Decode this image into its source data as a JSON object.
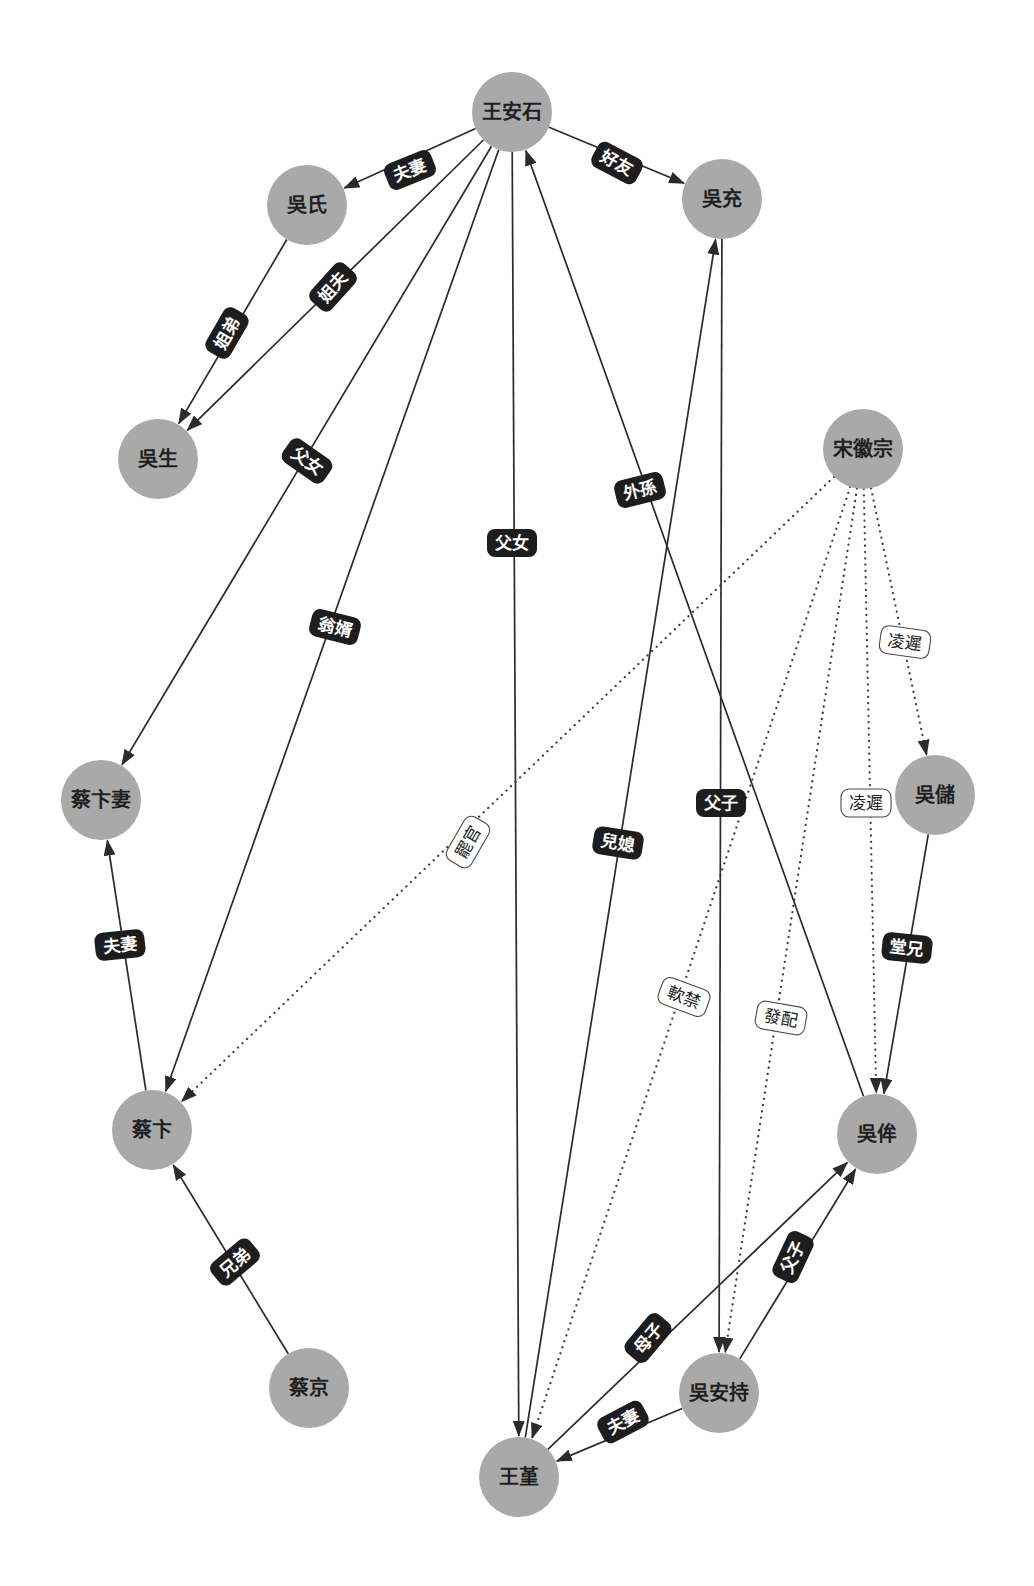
{
  "diagram": {
    "node_radius": 40,
    "colors": {
      "background": "#ffffff",
      "node_fill": "#a9a9a9",
      "node_text": "#1f1f1f",
      "edge": "#2b2b2b",
      "label_solid_bg": "#1d1d1d",
      "label_solid_text": "#ffffff",
      "label_dotted_bg": "#ffffff",
      "label_dotted_border": "#4a4a4a"
    },
    "nodes": [
      {
        "id": "wanganshi",
        "label": "王安石",
        "x": 512,
        "y": 112
      },
      {
        "id": "wushi",
        "label": "吳氏",
        "x": 307,
        "y": 205
      },
      {
        "id": "wuchong",
        "label": "吳充",
        "x": 722,
        "y": 199
      },
      {
        "id": "wusheng",
        "label": "吳生",
        "x": 158,
        "y": 459
      },
      {
        "id": "songhuizong",
        "label": "宋徽宗",
        "x": 863,
        "y": 449
      },
      {
        "id": "caibianqi",
        "label": "蔡卞妻",
        "x": 101,
        "y": 800
      },
      {
        "id": "wuchu",
        "label": "吳儲",
        "x": 935,
        "y": 795
      },
      {
        "id": "caibian",
        "label": "蔡卞",
        "x": 152,
        "y": 1130
      },
      {
        "id": "wumou",
        "label": "吳侔",
        "x": 877,
        "y": 1134
      },
      {
        "id": "caijing",
        "label": "蔡京",
        "x": 309,
        "y": 1388
      },
      {
        "id": "wuanchi",
        "label": "吳安持",
        "x": 719,
        "y": 1393
      },
      {
        "id": "wangjin",
        "label": "王堇",
        "x": 519,
        "y": 1477
      }
    ],
    "edges": [
      {
        "from": "wanganshi",
        "to": "wushi",
        "label": "夫妻",
        "style": "solid",
        "lx": 410,
        "ly": 170,
        "rot": -22
      },
      {
        "from": "wanganshi",
        "to": "wuchong",
        "label": "好友",
        "style": "solid",
        "lx": 617,
        "ly": 163,
        "rot": 28
      },
      {
        "from": "wushi",
        "to": "wusheng",
        "label": "姐弟",
        "style": "solid",
        "lx": 227,
        "ly": 333,
        "rot": -60
      },
      {
        "from": "wanganshi",
        "to": "wusheng",
        "label": "姐夫",
        "style": "solid",
        "lx": 333,
        "ly": 287,
        "rot": -48
      },
      {
        "from": "wanganshi",
        "to": "caibianqi",
        "label": "父女",
        "style": "solid",
        "lx": 307,
        "ly": 461,
        "rot": 35
      },
      {
        "from": "wanganshi",
        "to": "caibian",
        "label": "翁婿",
        "style": "solid",
        "lx": 335,
        "ly": 627,
        "rot": 14
      },
      {
        "from": "wanganshi",
        "to": "wangjin",
        "label": "父女",
        "style": "solid",
        "lx": 512,
        "ly": 543,
        "rot": 0
      },
      {
        "from": "wumou",
        "to": "wanganshi",
        "label": "外孫",
        "style": "solid",
        "lx": 640,
        "ly": 490,
        "rot": -14
      },
      {
        "from": "wangjin",
        "to": "wuchong",
        "label": "兒媳",
        "style": "solid",
        "lx": 618,
        "ly": 843,
        "rot": 9
      },
      {
        "from": "wuchong",
        "to": "wuanchi",
        "label": "父子",
        "style": "solid",
        "lx": 721,
        "ly": 803,
        "rot": 0
      },
      {
        "from": "wuchu",
        "to": "wumou",
        "label": "堂兄",
        "style": "solid",
        "lx": 907,
        "ly": 948,
        "rot": 6
      },
      {
        "from": "caibian",
        "to": "caibianqi",
        "label": "夫妻",
        "style": "solid",
        "lx": 120,
        "ly": 945,
        "rot": -6
      },
      {
        "from": "caijing",
        "to": "caibian",
        "label": "兄弟",
        "style": "solid",
        "lx": 235,
        "ly": 1262,
        "rot": -40
      },
      {
        "from": "wangjin",
        "to": "wumou",
        "label": "母子",
        "style": "solid",
        "lx": 648,
        "ly": 1338,
        "rot": -50
      },
      {
        "from": "wuanchi",
        "to": "wumou",
        "label": "父子",
        "style": "solid",
        "lx": 793,
        "ly": 1257,
        "rot": -65
      },
      {
        "from": "wuanchi",
        "to": "wangjin",
        "label": "夫妻",
        "style": "solid",
        "lx": 623,
        "ly": 1422,
        "rot": -28
      },
      {
        "from": "songhuizong",
        "to": "caibian",
        "label": "罷官",
        "style": "dotted",
        "lx": 468,
        "ly": 842,
        "rot": -60
      },
      {
        "from": "songhuizong",
        "to": "wangjin",
        "label": "軟禁",
        "style": "dotted",
        "lx": 684,
        "ly": 997,
        "rot": 20
      },
      {
        "from": "songhuizong",
        "to": "wuanchi",
        "label": "發配",
        "style": "dotted",
        "lx": 781,
        "ly": 1018,
        "rot": 10
      },
      {
        "from": "songhuizong",
        "to": "wumou",
        "label": "凌遲",
        "style": "dotted",
        "lx": 866,
        "ly": 803,
        "rot": 0
      },
      {
        "from": "songhuizong",
        "to": "wuchu",
        "label": "凌遲",
        "style": "dotted",
        "lx": 905,
        "ly": 642,
        "rot": 8
      }
    ]
  }
}
